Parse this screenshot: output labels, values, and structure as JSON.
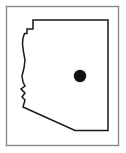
{
  "figure": {
    "width": 126,
    "height": 153,
    "background_color": "#ffffff"
  },
  "frame": {
    "name": "figure-border",
    "x": 6.5,
    "y": 6.5,
    "width": 112,
    "height": 139,
    "stroke_color": "#8a8a8a",
    "stroke_width": 1.4,
    "fill_color": "#ffffff"
  },
  "map": {
    "region_name": "Arizona",
    "outline_color": "#1a1a1a",
    "outline_width": 1.5,
    "fill_color": "#ffffff",
    "outline_points": "108,20 33,20 33,29 27,29 27,33.5 24.5,33.5 23,38 22.5,44 23.5,52 25,60 24,68 22,76 23,82 25,86 21,89 25,93 22,97 25,100 23,107 75,130.5 108,130.5 108,20"
  },
  "marker": {
    "name": "location-dot",
    "label": "",
    "cx": 80,
    "cy": 76,
    "r": 6.2,
    "fill_color": "#111111"
  }
}
